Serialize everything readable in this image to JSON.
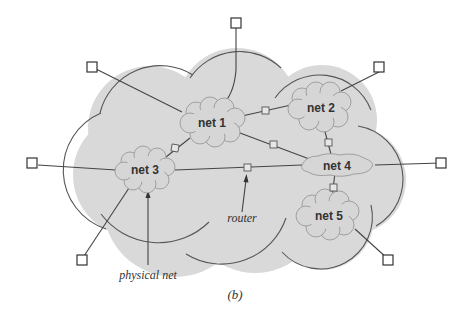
{
  "figure": {
    "caption": "(b)",
    "colors": {
      "cloud_fill": "#d9d9d9",
      "cloud_stroke": "#555555",
      "line": "#444444",
      "host_fill": "#ffffff",
      "text": "#333333"
    }
  },
  "networks": [
    {
      "id": "net1",
      "label": "net 1"
    },
    {
      "id": "net2",
      "label": "net 2"
    },
    {
      "id": "net3",
      "label": "net 3"
    },
    {
      "id": "net4",
      "label": "net 4"
    },
    {
      "id": "net5",
      "label": "net 5"
    }
  ],
  "routers": [
    {
      "between": [
        "net1",
        "net2"
      ]
    },
    {
      "between": [
        "net1",
        "net3"
      ]
    },
    {
      "between": [
        "net1",
        "net4"
      ]
    },
    {
      "between": [
        "net2",
        "net4"
      ]
    },
    {
      "between": [
        "net3",
        "net4"
      ]
    },
    {
      "between": [
        "net4",
        "net5"
      ]
    }
  ],
  "hosts": [
    {
      "attached_to": "net1"
    },
    {
      "attached_to": "net1"
    },
    {
      "attached_to": "net2"
    },
    {
      "attached_to": "net3"
    },
    {
      "attached_to": "net3"
    },
    {
      "attached_to": "net4"
    },
    {
      "attached_to": "net5"
    }
  ],
  "annotations": {
    "router_label": "router",
    "physical_net_label": "physical net"
  }
}
